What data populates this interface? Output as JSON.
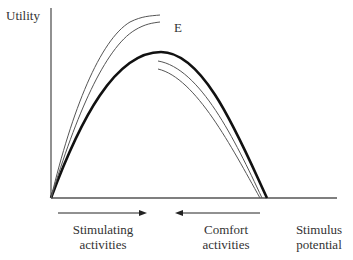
{
  "diagram": {
    "y_axis_label": "Utility",
    "x_axis_label_line1": "Stimulus",
    "x_axis_label_line2": "potential",
    "curve_label": "E",
    "left_arrow_label_line1": "Stimulating",
    "left_arrow_label_line2": "activities",
    "right_arrow_label_line1": "Comfort",
    "right_arrow_label_line2": "activities",
    "left_arrow_direction": "right",
    "right_arrow_direction": "left",
    "colors": {
      "axis": "#555555",
      "main_curve": "#111111",
      "thin_curves": "#555555"
    }
  }
}
